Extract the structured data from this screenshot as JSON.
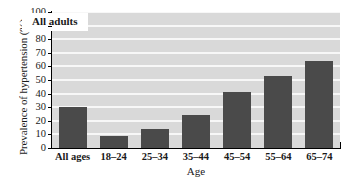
{
  "chart_data": {
    "type": "bar",
    "title": "",
    "subtitle": "",
    "xlabel": "Age",
    "ylabel": "Prevalence of hypertension (%)",
    "categories": [
      "All ages",
      "18–24",
      "25–34",
      "35–44",
      "45–54",
      "55–64",
      "65–74"
    ],
    "values": [
      30,
      9,
      14,
      24,
      41,
      53,
      64
    ],
    "series": [
      {
        "name": "All adults",
        "values": [
          30,
          9,
          14,
          24,
          41,
          53,
          64
        ]
      }
    ],
    "ylim": [
      0,
      100
    ],
    "ytick_step": 10,
    "yticks": [
      0,
      10,
      20,
      30,
      40,
      50,
      60,
      70,
      80,
      90,
      100
    ],
    "ytick_labels": [
      "0",
      "10",
      "20",
      "30",
      "40",
      "50",
      "60",
      "70",
      "80",
      "90",
      "100"
    ],
    "grid": true,
    "grid_orientation": "horizontal",
    "legend_position": "none",
    "annotations": [
      {
        "text": "All adults",
        "kind": "boxed-label",
        "position": "upper-left-inside-plot"
      }
    ],
    "colors": {
      "bar": "#4a4a4a",
      "plot_background": "#d9d9d9",
      "gridline": "#f7f7f7",
      "axis": "#000000",
      "figure_background": "#ffffff",
      "text": "#1a1a1a",
      "annotation_background": "#ffffff"
    }
  }
}
